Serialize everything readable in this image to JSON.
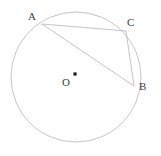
{
  "figure": {
    "kind": "circle-geometry-diagram",
    "width": 161,
    "height": 156,
    "background_color": "#ffffff",
    "stroke_color": "#b5b5b5",
    "label_color": "#3a3a3a",
    "center_dot_color": "#1a1a1a"
  },
  "circle": {
    "label": "circle",
    "center_x": 76,
    "center_y": 77,
    "radius": 65,
    "stroke_width": 0.8
  },
  "center": {
    "label": "O",
    "dot_x": 75,
    "dot_y": 74,
    "dot_radius": 1.6
  },
  "points": [
    {
      "label": "A",
      "x": 42,
      "y": 24
    },
    {
      "label": "C",
      "x": 126,
      "y": 31
    },
    {
      "label": "B",
      "x": 134,
      "y": 86
    }
  ],
  "chords": [
    {
      "label": "AC",
      "from": "A",
      "to": "C",
      "x1": 42,
      "y1": 24,
      "x2": 126,
      "y2": 31
    },
    {
      "label": "AB",
      "from": "A",
      "to": "B",
      "x1": 42,
      "y1": 24,
      "x2": 134,
      "y2": 86
    },
    {
      "label": "CB",
      "from": "C",
      "to": "B",
      "x1": 126,
      "y1": 31,
      "x2": 134,
      "y2": 86
    }
  ]
}
